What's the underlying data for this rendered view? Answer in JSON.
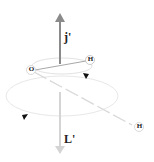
{
  "diagram": {
    "vectors": [
      {
        "id": "j",
        "label": "j'",
        "direction": "up",
        "color": "#8a8a8a"
      },
      {
        "id": "L",
        "label": "L'",
        "direction": "down",
        "color": "#cfcfcf"
      }
    ],
    "atoms": [
      {
        "id": "O",
        "label": "O"
      },
      {
        "id": "H1",
        "label": "H"
      },
      {
        "id": "H2",
        "label": "H"
      }
    ],
    "orbits": [
      {
        "id": "inner",
        "description": "small precession ellipse around j'"
      },
      {
        "id": "outer",
        "description": "large rotation ellipse around L'"
      }
    ],
    "colors": {
      "dark_arrow": "#8a8a8a",
      "light_arrow": "#cfcfcf",
      "ellipse": "#e6e6e6",
      "bond": "#b0b0b0",
      "text": "#222222"
    }
  }
}
